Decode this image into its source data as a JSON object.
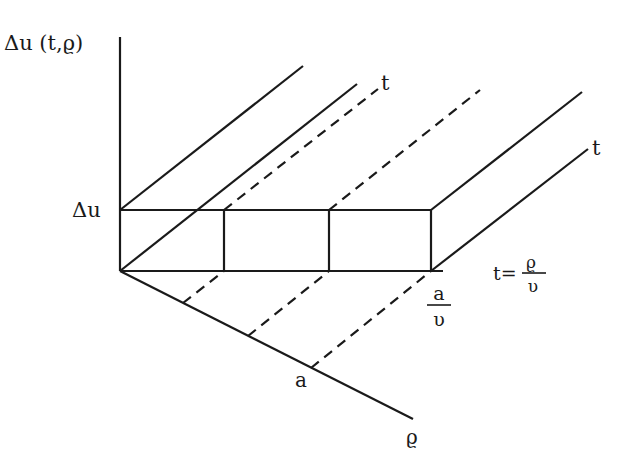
{
  "diagram": {
    "type": "3d-axis-sketch",
    "labels": {
      "y_axis": "Δu (t,ϱ)",
      "delta_u": "Δu",
      "t_top": "t",
      "t_right": "t",
      "t_eq_lhs": "t=",
      "t_eq_num": "ϱ",
      "t_eq_den": "υ",
      "a_over_v_num": "a",
      "a_over_v_den": "υ",
      "a_label": "a",
      "rho_label": "ϱ"
    },
    "colors": {
      "ink": "#1a1a1a",
      "background": "#ffffff"
    }
  }
}
